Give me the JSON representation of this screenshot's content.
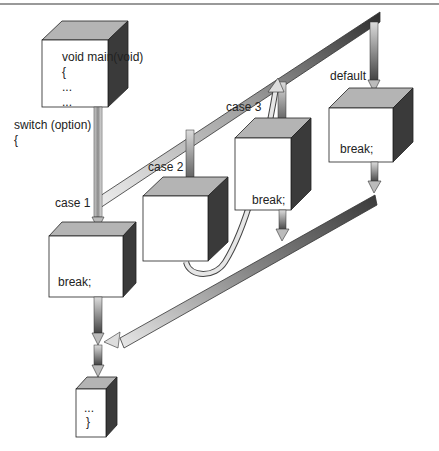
{
  "main_block": {
    "lines": [
      "void main(void)",
      "{",
      "...",
      "..."
    ]
  },
  "switch_label": {
    "line1": "switch (option)",
    "line2": "{"
  },
  "cases": [
    {
      "label": "case 1",
      "body": "break;"
    },
    {
      "label": "case 2",
      "body": ""
    },
    {
      "label": "case 3",
      "body": "break;"
    },
    {
      "label": "default",
      "body": "break;"
    }
  ],
  "end_block": {
    "lines": [
      "...",
      "}"
    ]
  },
  "colors": {
    "box_front": "#ffffff",
    "box_top": "#b4b4b4",
    "box_side": "#3a3a3a",
    "bar_light": "#e6e6e6",
    "bar_dark": "#555555",
    "outline": "#222222"
  }
}
